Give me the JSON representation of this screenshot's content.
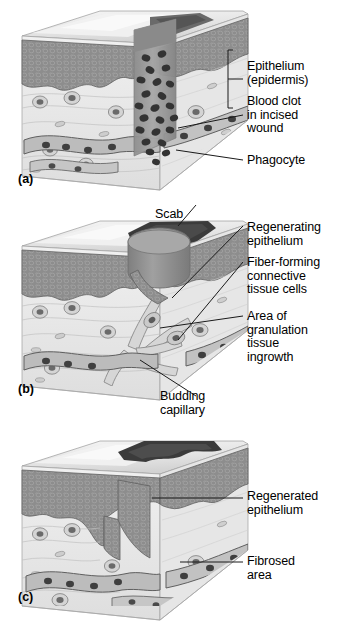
{
  "figure": {
    "title_visible": false,
    "style": "grayscale medical illustration",
    "background": "#ffffff",
    "text_color": "#000000",
    "leader_line_color": "#1a1a1a"
  },
  "palette": {
    "epidermis": "#8d8d8d",
    "epidermis_dark": "#6f6f6f",
    "scab": "#3b3b3b",
    "clot_plug": "#9a9a9a",
    "clot_cell": "#3a3a3a",
    "dermis": "#ececec",
    "dermis_shade": "#dcdcdc",
    "dermis_side": "#e3e3e3",
    "top_surface": "#e8e8e8",
    "top_highlight": "#f4f4f4",
    "vessel": "#b6b6b6",
    "vessel_outline": "#5d5d5d",
    "cell_nucleus": "#3f3f3f",
    "granulation": "#c9c9c9",
    "outline": "#707070"
  },
  "panels": [
    {
      "id": "a",
      "tag": "(a)",
      "stage": "Inflammation: blood clot fills incised wound",
      "labels": [
        {
          "key": "epithelium",
          "text": "Epithelium\n(epidermis)",
          "bracket": true
        },
        {
          "key": "blood_clot",
          "text": "Blood clot\nin incised\nwound",
          "bracket": false
        },
        {
          "key": "phagocyte",
          "text": "Phagocyte",
          "bracket": false
        }
      ]
    },
    {
      "id": "b",
      "tag": "(b)",
      "stage": "Organization: granulation tissue and regenerating epithelium",
      "labels": [
        {
          "key": "scab",
          "text": "Scab",
          "bracket": false
        },
        {
          "key": "regenerating",
          "text": "Regenerating\nepithelium",
          "bracket": false
        },
        {
          "key": "fiber_cells",
          "text": "Fiber-forming\nconnective\ntissue cells",
          "bracket": false
        },
        {
          "key": "granulation",
          "text": "Area of\ngranulation\ntissue\ningrowth",
          "bracket": false
        },
        {
          "key": "capillary",
          "text": "Budding\ncapillary",
          "bracket": false
        }
      ]
    },
    {
      "id": "c",
      "tag": "(c)",
      "stage": "Regeneration: scar (fibrosed area) under regenerated epithelium",
      "labels": [
        {
          "key": "regenerated",
          "text": "Regenerated\nepithelium",
          "bracket": false
        },
        {
          "key": "fibrosed",
          "text": "Fibrosed\narea",
          "bracket": false
        }
      ]
    }
  ]
}
